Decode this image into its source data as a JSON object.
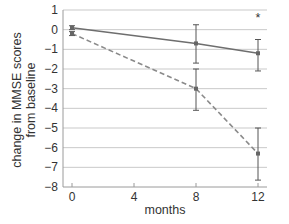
{
  "chart_data": {
    "type": "line",
    "title": "",
    "xlabel": "months",
    "ylabel_line1": "change in MMSE scores",
    "ylabel_line2": "from baseline",
    "ylabel": "change in MMSE scores from baseline",
    "xlim": [
      0,
      12
    ],
    "ylim": [
      -8,
      1
    ],
    "x_ticks": [
      0,
      4,
      8,
      12
    ],
    "y_ticks": [
      1,
      0,
      -1,
      -2,
      -3,
      -4,
      -5,
      -6,
      -7,
      -8
    ],
    "x_tick_labels": [
      "0",
      "4",
      "8",
      "12"
    ],
    "y_tick_labels": [
      "1",
      "0",
      "−1",
      "−2",
      "−3",
      "−4",
      "−5",
      "−6",
      "−7",
      "−8"
    ],
    "grid": "horizontal",
    "legend": null,
    "annotations": [
      {
        "text": "*",
        "x": 12,
        "y": 0.7
      }
    ],
    "x": [
      0,
      8,
      12
    ],
    "series": [
      {
        "name": "solid",
        "style": "solid",
        "color": "#6e6e6e",
        "values": [
          0.1,
          -0.7,
          -1.2
        ],
        "error_low": [
          0.0,
          -1.7,
          -2.1
        ],
        "error_high": [
          0.2,
          0.25,
          -0.5
        ]
      },
      {
        "name": "dashed",
        "style": "dashed",
        "color": "#8a8a8a",
        "values": [
          -0.2,
          -3.0,
          -6.3
        ],
        "error_low": [
          -0.3,
          -4.1,
          -7.65
        ],
        "error_high": [
          -0.1,
          -2.0,
          -5.0
        ]
      }
    ]
  }
}
